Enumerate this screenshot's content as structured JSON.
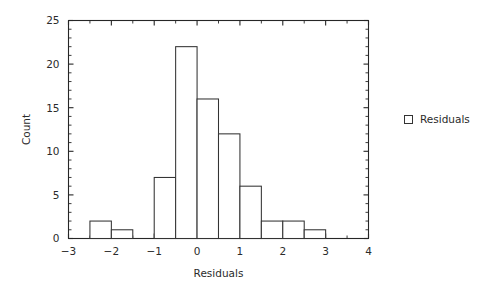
{
  "chart_data": {
    "type": "bar",
    "title": "",
    "subtitle": "",
    "xlabel": "Residuals",
    "ylabel": "Count",
    "xlim": [
      -3,
      4
    ],
    "ylim": [
      0,
      25
    ],
    "grid": false,
    "bin_width": 0.5,
    "x_major_ticks": [
      -3,
      -2,
      -1,
      0,
      1,
      2,
      3,
      4
    ],
    "x_major_tick_labels": [
      "−3",
      "−2",
      "−1",
      "0",
      "1",
      "2",
      "3",
      "4"
    ],
    "x_minor_tick_step": 0.5,
    "y_major_ticks": [
      0,
      5,
      10,
      15,
      20,
      25
    ],
    "y_major_tick_labels": [
      "0",
      "5",
      "10",
      "15",
      "20",
      "25"
    ],
    "y_minor_tick_step": 1,
    "legend": {
      "position": "right",
      "entries": [
        {
          "label": "Residuals",
          "marker": "open-square",
          "fill": "#ffffff",
          "stroke": "#333333"
        }
      ]
    },
    "series": [
      {
        "name": "Residuals",
        "bins": [
          {
            "x0": -2.5,
            "x1": -2.0,
            "count": 2
          },
          {
            "x0": -2.0,
            "x1": -1.5,
            "count": 1
          },
          {
            "x0": -1.5,
            "x1": -1.0,
            "count": 0
          },
          {
            "x0": -1.0,
            "x1": -0.5,
            "count": 7
          },
          {
            "x0": -0.5,
            "x1": 0.0,
            "count": 22
          },
          {
            "x0": 0.0,
            "x1": 0.5,
            "count": 16
          },
          {
            "x0": 0.5,
            "x1": 1.0,
            "count": 12
          },
          {
            "x0": 1.0,
            "x1": 1.5,
            "count": 6
          },
          {
            "x0": 1.5,
            "x1": 2.0,
            "count": 2
          },
          {
            "x0": 2.0,
            "x1": 2.5,
            "count": 2
          },
          {
            "x0": 2.5,
            "x1": 3.0,
            "count": 1
          }
        ]
      }
    ]
  },
  "colors": {
    "background": "#ffffff",
    "axis": "#262626",
    "bar_stroke": "#333333",
    "bar_fill": "#ffffff",
    "text": "#2b2b2b"
  }
}
